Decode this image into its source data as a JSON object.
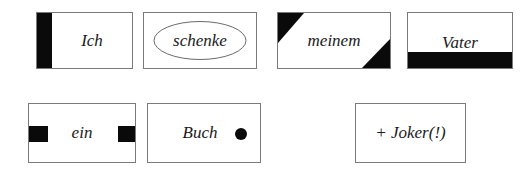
{
  "diagram": {
    "cards": [
      {
        "id": "ich",
        "label": "Ich",
        "marker": "left-bar"
      },
      {
        "id": "schenke",
        "label": "schenke",
        "marker": "ellipse"
      },
      {
        "id": "meinem",
        "label": "meinem",
        "marker": "diagonal-corners"
      },
      {
        "id": "vater",
        "label": "Vater",
        "marker": "bottom-bar"
      },
      {
        "id": "ein",
        "label": "ein",
        "marker": "side-squares"
      },
      {
        "id": "buch",
        "label": "Buch",
        "marker": "dot"
      },
      {
        "id": "joker",
        "label": "+ Joker(!)",
        "marker": "none"
      }
    ],
    "colors": {
      "border": "#7a7a7a",
      "fill": "#0a0a0a",
      "text": "#1a1a1a",
      "background": "#ffffff"
    }
  }
}
